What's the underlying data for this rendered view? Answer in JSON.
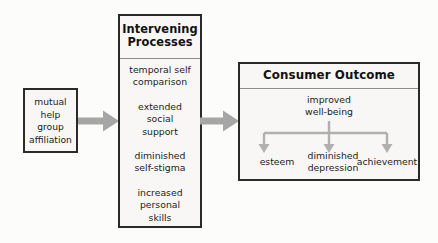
{
  "diagram": {
    "colors": {
      "background": "#fcfcfb",
      "box_fill": "#f8f7f5",
      "box_border": "#2a2a2a",
      "rule": "#8d8d8d",
      "arrow": "#a6a6a6",
      "text": "#1b1b1b"
    },
    "antecedent": {
      "label": "mutual\nhelp\ngroup\naffiliation",
      "lines": [
        "mutual",
        "help",
        "group",
        "affiliation"
      ]
    },
    "mediator": {
      "title_line1": "Intervening",
      "title_line2": "Processes",
      "items": [
        {
          "lines": [
            "temporal self",
            "comparison"
          ]
        },
        {
          "lines": [
            "extended",
            "social",
            "support"
          ]
        },
        {
          "lines": [
            "diminished",
            "self-stigma"
          ]
        },
        {
          "lines": [
            "increased",
            "personal",
            "skills"
          ]
        }
      ]
    },
    "outcome": {
      "title": "Consumer Outcome",
      "primary": {
        "lines": [
          "improved",
          "well-being"
        ]
      },
      "branches": [
        {
          "lines": [
            "esteem"
          ]
        },
        {
          "lines": [
            "diminished",
            "depression"
          ]
        },
        {
          "lines": [
            "achievement"
          ]
        }
      ]
    },
    "connectors": [
      {
        "name": "antecedent-to-mediator",
        "direction": "right"
      },
      {
        "name": "mediator-to-outcome",
        "direction": "right"
      }
    ]
  }
}
